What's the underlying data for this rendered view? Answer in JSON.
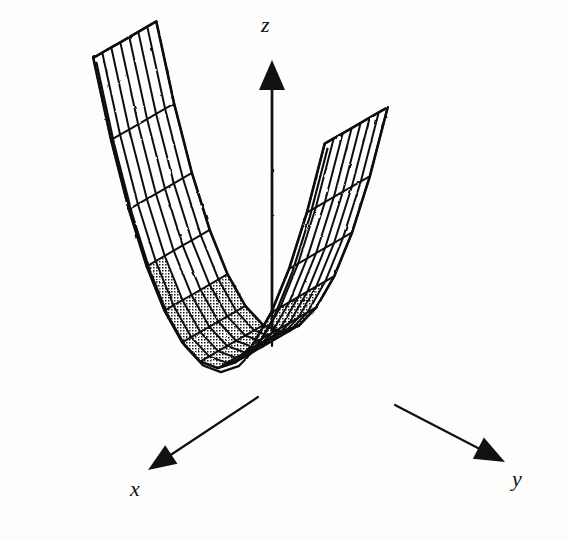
{
  "figure": {
    "kind": "3d-surface-mesh-plot",
    "background_color": "#fdfdfc",
    "ink_color": "#111111",
    "style": "scanned line drawing, stippled shading"
  },
  "axes": {
    "x": {
      "label": "x",
      "arrow_direction": "down-left",
      "origin_px": [
        258,
        397
      ],
      "tip_px": [
        148,
        470
      ]
    },
    "y": {
      "label": "y",
      "arrow_direction": "down-right",
      "origin_px": [
        395,
        405
      ],
      "tip_px": [
        505,
        462
      ]
    },
    "z": {
      "label": "z",
      "arrow_direction": "up",
      "origin_px": [
        272,
        330
      ],
      "tip_px": [
        272,
        60
      ]
    }
  },
  "chart_data": {
    "type": "surface",
    "title": "",
    "xlabel": "x",
    "ylabel": "y",
    "zlabel": "z",
    "surface_description": "parabolic cylinder rising steeply on the far (y) side, ruled straight along the x direction",
    "equation": "z = y^2",
    "grid": {
      "u_divisions": 13,
      "v_divisions": 7,
      "u_axis": "y",
      "v_axis": "x"
    },
    "shading": {
      "front_face": "stippled",
      "back_face": "white",
      "stipple_spacing_px": 3
    },
    "projection": {
      "type": "oblique-3d",
      "origin_px": [
        272,
        330
      ],
      "x_unit_px": [
        -9.0,
        5.2
      ],
      "y_unit_px": [
        17.8,
        6.6
      ],
      "z_unit_px": [
        0.0,
        -16.5
      ]
    },
    "x_range": [
      0,
      7
    ],
    "y_range": [
      -6.5,
      6.5
    ],
    "z_range": [
      0,
      16
    ],
    "values_note": "z depends only on y; z = (y/1.62)^2 scaled to fill the frame"
  }
}
